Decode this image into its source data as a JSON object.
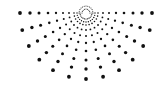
{
  "graphic": {
    "name": "radial-dot-sunburst",
    "center": [
      86,
      13
    ],
    "ray_count": 13,
    "start_angle_deg": 0,
    "end_angle_deg": 180,
    "dot_color": "#111111",
    "background": "#ffffff",
    "rings": [
      {
        "r": 6,
        "size": 0.6
      },
      {
        "r": 9,
        "size": 0.7
      },
      {
        "r": 12,
        "size": 0.8
      },
      {
        "r": 17,
        "size": 0.9
      },
      {
        "r": 23,
        "size": 1.0
      },
      {
        "r": 30,
        "size": 1.15
      },
      {
        "r": 38,
        "size": 1.3
      },
      {
        "r": 47,
        "size": 1.5
      },
      {
        "r": 56,
        "size": 1.7
      },
      {
        "r": 66,
        "size": 1.9
      }
    ],
    "inner_arcs": [
      {
        "r": 4,
        "dots": 9,
        "size": 0.5
      },
      {
        "r": 7,
        "dots": 13,
        "size": 0.5
      }
    ],
    "max_vertical_extent": 67,
    "max_horizontal_extent": 66
  }
}
